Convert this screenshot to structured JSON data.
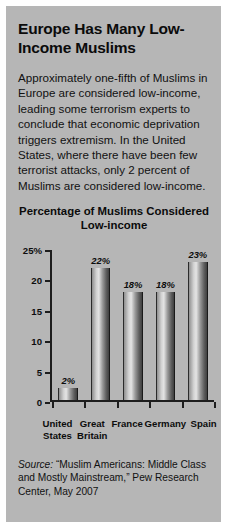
{
  "headline": "Europe Has Many Low-Income Muslims",
  "body": "Approximately one-fifth of Muslims in Europe are considered low-income, leading some terrorism experts to conclude that economic deprivation triggers extremism. In the United States, where there have been few terrorist attacks, only 2 percent of Muslims are considered low-income.",
  "source": {
    "label": "Source:",
    "text": "“Muslim Americans: Middle Class and Mostly Mainstream,” Pew Research Center, May 2007"
  },
  "chart_data": {
    "type": "bar",
    "title": "Percentage of Muslims Considered Low-income",
    "categories": [
      "United States",
      "Great Britain",
      "France",
      "Germany",
      "Spain"
    ],
    "values": [
      2,
      22,
      18,
      18,
      23
    ],
    "data_labels": [
      "2%",
      "22%",
      "18%",
      "18%",
      "23%"
    ],
    "xlabel": "",
    "ylabel": "",
    "ylim": [
      0,
      25
    ],
    "yticks": [
      0,
      5,
      10,
      15,
      20,
      25
    ],
    "ytick_labels": [
      "0",
      "5",
      "10",
      "15",
      "20",
      "25%"
    ],
    "grid": false,
    "legend": false
  },
  "colors": {
    "panel_background": "#b6b6b6",
    "text": "#0d0d0d",
    "axis": "#1d1d1d"
  }
}
